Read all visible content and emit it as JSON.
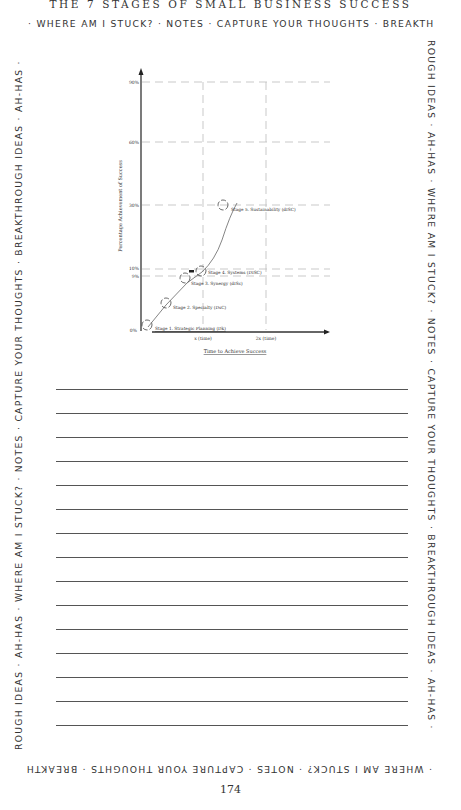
{
  "header": {
    "title": "THE 7 STAGES OF SMALL BUSINESS SUCCESS"
  },
  "border": {
    "top": "· WHERE AM I STUCK? · NOTES · CAPTURE YOUR THOUGHTS · BREAKTH",
    "right": "ROUGH IDEAS · AH-HAS · WHERE AM I STUCK? · NOTES · CAPTURE YOUR THOUGHTS · BREAKTHROUGH IDEAS · AH-HAS ·",
    "bottom": "· WHERE AM I STUCK? · NOTES · CAPTURE YOUR THOUGHTS · BREAKTH",
    "left": "ROUGH IDEAS · AH-HAS · WHERE AM I STUCK? · NOTES · CAPTURE YOUR THOUGHTS · BREAKTHROUGH IDEAS · AH-HAS ·"
  },
  "chart_data": {
    "type": "line",
    "title": "",
    "xlabel": "Time to Achieve Success",
    "ylabel": "Percentage Achievement of Success",
    "x_ticks": [
      "x (time)",
      "2x (time)"
    ],
    "y_ticks": [
      "0%",
      "9%",
      "10%",
      "30%",
      "60%",
      "90%"
    ],
    "y_tick_values": [
      0,
      9,
      10,
      30,
      60,
      90
    ],
    "grid": "dashed",
    "series": [
      {
        "name": "Stages",
        "points": [
          {
            "label": "Stage 1. Strategic Planning (Dk)",
            "x": 0.02,
            "y": 0
          },
          {
            "label": "Stage 2. Specialty (DsC)",
            "x": 0.3,
            "y": 4
          },
          {
            "label": "Stage 3. Synergy (dISc)",
            "x": 0.6,
            "y": 8
          },
          {
            "label": "Stage 4. Systems (DISC)",
            "x": 0.85,
            "y": 10
          },
          {
            "label": "Stage 5. Sustainability (dISC)",
            "x": 1.2,
            "y": 30
          }
        ]
      }
    ],
    "annotations": [
      "Stage 1. Strategic Planning (Dk)",
      "Stage 2. Specialty (DsC)",
      "Stage 3. Synergy (dISc)",
      "Stage 4. Systems (DISC)",
      "Stage 5. Sustainability (dISC)"
    ]
  },
  "notes": {
    "line_count": 15
  },
  "footer": {
    "page_number": "174"
  }
}
